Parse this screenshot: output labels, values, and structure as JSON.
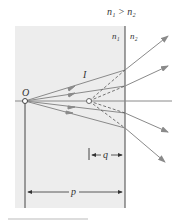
{
  "diagram": {
    "title_condition": "n₁ > n₂",
    "medium1_label": "n₁",
    "medium2_label": "n₂",
    "object_label": "O",
    "image_label": "I",
    "image_distance_label": "q",
    "object_distance_label": "p",
    "colors": {
      "medium1_fill": "#ededed",
      "ray": "#8a8a8a",
      "line": "#444444"
    }
  }
}
